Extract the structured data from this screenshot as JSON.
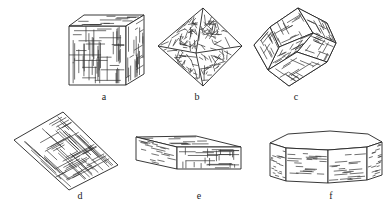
{
  "figure": {
    "panels": [
      {
        "id": "a",
        "label": "a",
        "shape": "cube"
      },
      {
        "id": "b",
        "label": "b",
        "shape": "octahedron"
      },
      {
        "id": "c",
        "label": "c",
        "shape": "rhombic-dodecahedron"
      },
      {
        "id": "d",
        "label": "d",
        "shape": "thin-plate"
      },
      {
        "id": "e",
        "label": "e",
        "shape": "tabular-prism"
      },
      {
        "id": "f",
        "label": "f",
        "shape": "octagonal-prism"
      }
    ]
  },
  "colors": {
    "line": "#222222",
    "background": "#ffffff"
  }
}
